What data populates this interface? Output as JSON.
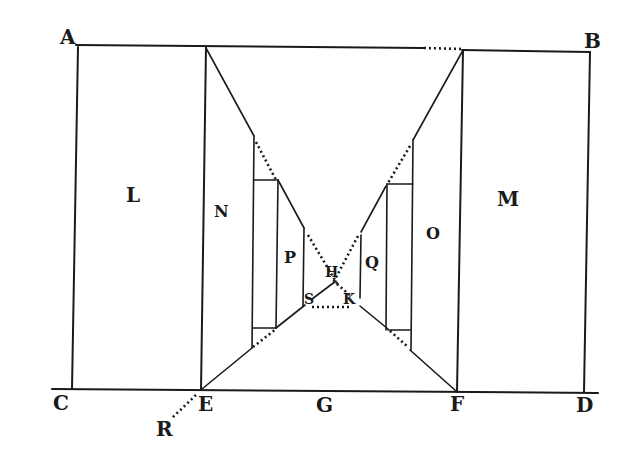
{
  "figure": {
    "type": "perspective geometry diagram",
    "background": "#ffffff",
    "ink_color": "#1a1a1a"
  },
  "labels": {
    "A": "A",
    "B": "B",
    "C": "C",
    "D": "D",
    "E": "E",
    "F": "F",
    "G": "G",
    "H": "H",
    "K": "K",
    "L": "L",
    "M": "M",
    "N": "N",
    "O": "O",
    "P": "P",
    "Q": "Q",
    "R": "R",
    "S": "S"
  },
  "regions": [
    {
      "name": "L",
      "description": "left outer rectangle"
    },
    {
      "name": "M",
      "description": "right outer rectangle"
    },
    {
      "name": "N",
      "description": "left receding wall"
    },
    {
      "name": "O",
      "description": "right receding wall"
    },
    {
      "name": "P",
      "description": "inner left wall"
    },
    {
      "name": "Q",
      "description": "inner right wall"
    }
  ]
}
